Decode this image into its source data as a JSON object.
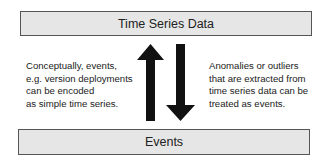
{
  "diagram": {
    "top_box": {
      "label": "Time Series Data"
    },
    "bottom_box": {
      "label": "Events"
    },
    "left_note": {
      "lines": [
        "Conceptually, events,",
        "e.g. version deployments",
        "can be encoded",
        "as simple time series."
      ]
    },
    "right_note": {
      "lines": [
        "Anomalies or outliers",
        "that are extracted from",
        "time series data can be",
        "treated as events."
      ]
    },
    "arrows": [
      {
        "direction": "up",
        "from": "Events",
        "to": "Time Series Data",
        "icon": "arrow-up-icon"
      },
      {
        "direction": "down",
        "from": "Time Series Data",
        "to": "Events",
        "icon": "arrow-down-icon"
      }
    ],
    "colors": {
      "box_fill": "#e6e6e6",
      "box_border": "#555555",
      "arrow": "#111111"
    }
  }
}
